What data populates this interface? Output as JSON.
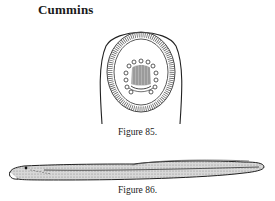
{
  "page": {
    "header": "Cummins"
  },
  "figures": [
    {
      "id": "fig85",
      "caption": "Figure 85.",
      "depicts": "oral-disc-illustration"
    },
    {
      "id": "fig86",
      "caption": "Figure 86.",
      "depicts": "lamprey-larva-illustration"
    }
  ]
}
